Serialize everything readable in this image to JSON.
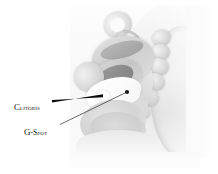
{
  "figure": {
    "type": "anatomical-illustration",
    "view": "sagittal-section",
    "background_color": "#ffffff",
    "plate_tone": "grayscale"
  },
  "labels": [
    {
      "id": "clitoris",
      "text": "Clitoris",
      "initial": "C",
      "rest": "litoris",
      "style": "small-caps",
      "color": "#121212",
      "x": 14,
      "y": 97,
      "leader": {
        "style": "tapered-wedge",
        "from_x": 52,
        "from_y": 101,
        "to_x": 103,
        "to_y": 95
      }
    },
    {
      "id": "g-spot",
      "text": "G-Spot",
      "initial": "G",
      "rest": "-Spot",
      "style": "small-caps",
      "color": "#121212",
      "x": 24,
      "y": 122,
      "leader": {
        "style": "thin-line",
        "from_x": 60,
        "from_y": 124,
        "to_x": 127,
        "to_y": 92,
        "endpoint": "dot"
      }
    }
  ],
  "structures": [
    {
      "name": "ovary-fallopian-loop",
      "tone": "#dcdcdc"
    },
    {
      "name": "uterus",
      "tone": "#cfcfcf"
    },
    {
      "name": "uterine-cavity",
      "tone": "#9f9f9f"
    },
    {
      "name": "bladder",
      "tone": "#d5d5d5"
    },
    {
      "name": "vaginal-canal",
      "tone": "#ffffff"
    },
    {
      "name": "rectum",
      "tone": "#d9d9d9"
    },
    {
      "name": "sacrum-vertebrae",
      "tone": "#d8d8d8"
    },
    {
      "name": "clitoral-bulb",
      "tone": "#ffffff"
    },
    {
      "name": "perineal-tissue",
      "tone": "#d4d4d4"
    },
    {
      "name": "body-contour",
      "tone": "#e9e9e9"
    }
  ]
}
